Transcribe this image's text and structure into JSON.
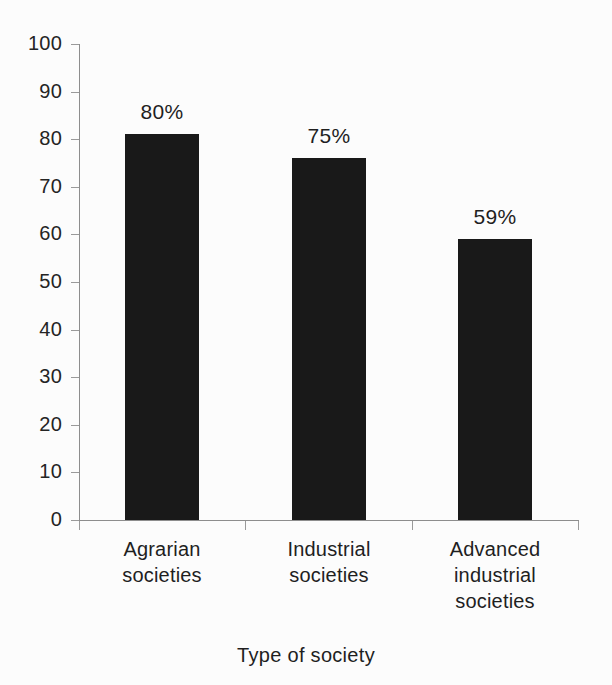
{
  "chart_data": {
    "type": "bar",
    "title": "",
    "subtitle": "",
    "xlabel": "Type of society",
    "ylabel": "",
    "categories": [
      "Agrarian societies",
      "Industrial societies",
      "Advanced industrial societies"
    ],
    "category_lines": [
      [
        "Agrarian",
        "societies"
      ],
      [
        "Industrial",
        "societies"
      ],
      [
        "Advanced",
        "industrial",
        "societies"
      ]
    ],
    "values": [
      81,
      76,
      59
    ],
    "data_labels": [
      "80%",
      "75%",
      "59%"
    ],
    "ylim": [
      0,
      100
    ],
    "ytick_values": [
      0,
      10,
      20,
      30,
      40,
      50,
      60,
      70,
      80,
      90,
      100
    ],
    "ytick_labels": [
      "0",
      "10",
      "20",
      "30",
      "40",
      "50",
      "60",
      "70",
      "80",
      "90",
      "100"
    ],
    "grid": false,
    "legend": false,
    "legend_position": "none",
    "bar_color": "#191919",
    "axis_color": "#8d8d8d",
    "background_color": "#fcfcfc",
    "text_color": "#1f1f1f"
  }
}
